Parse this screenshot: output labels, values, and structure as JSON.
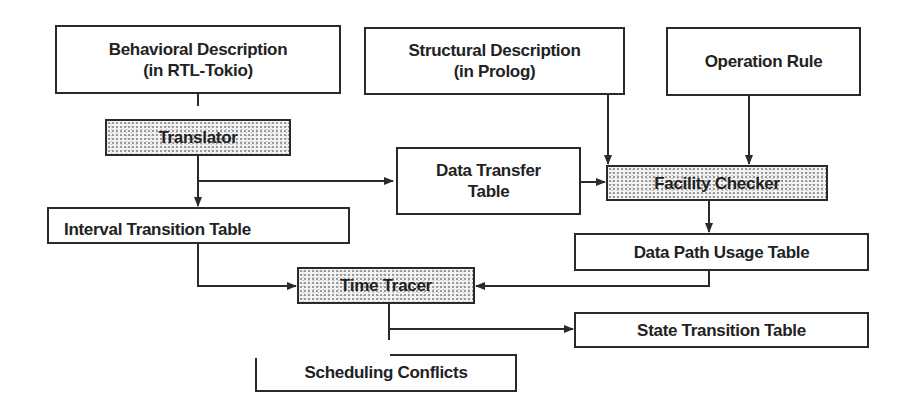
{
  "diagram": {
    "type": "flowchart",
    "nodes": {
      "behavioral_description": {
        "label": "Behavioral Description\n(in RTL-Tokio)",
        "shaded": false
      },
      "structural_description": {
        "label": "Structural Description\n(in Prolog)",
        "shaded": false
      },
      "operation_rule": {
        "label": "Operation Rule",
        "shaded": false
      },
      "translator": {
        "label": "Translator",
        "shaded": true
      },
      "data_transfer_table": {
        "label": "Data Transfer\nTable",
        "shaded": false
      },
      "facility_checker": {
        "label": "Facility Checker",
        "shaded": true
      },
      "interval_transition_table": {
        "label": "Interval Transition Table",
        "shaded": false
      },
      "data_path_usage_table": {
        "label": "Data Path Usage Table",
        "shaded": false
      },
      "time_tracer": {
        "label": "Time Tracer",
        "shaded": true
      },
      "state_transition_table": {
        "label": "State Transition Table",
        "shaded": false
      },
      "scheduling_conflicts": {
        "label": "Scheduling Conflicts",
        "shaded": false
      }
    },
    "edges": [
      {
        "from": "behavioral_description",
        "to": "translator"
      },
      {
        "from": "translator",
        "to": "interval_transition_table"
      },
      {
        "from": "translator",
        "to": "data_transfer_table"
      },
      {
        "from": "structural_description",
        "to": "facility_checker"
      },
      {
        "from": "operation_rule",
        "to": "facility_checker"
      },
      {
        "from": "data_transfer_table",
        "to": "facility_checker"
      },
      {
        "from": "facility_checker",
        "to": "data_path_usage_table"
      },
      {
        "from": "interval_transition_table",
        "to": "time_tracer"
      },
      {
        "from": "data_path_usage_table",
        "to": "time_tracer"
      },
      {
        "from": "time_tracer",
        "to": "state_transition_table"
      },
      {
        "from": "time_tracer",
        "to": "scheduling_conflicts"
      }
    ],
    "colors": {
      "line": "#2a2a2a",
      "background": "#ffffff",
      "shade": "#9a9a9a"
    }
  }
}
